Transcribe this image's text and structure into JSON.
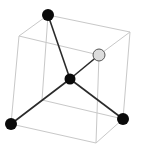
{
  "diagram": {
    "title": "",
    "colors": {
      "background": "#ffffff",
      "cube_edge": "#c8c8c8",
      "bond": "#2a2a2a",
      "atom_dark": "#0a0a0a",
      "atom_light": "#dcdcdc",
      "atom_light_stroke": "#555555"
    },
    "cube_vertices": {
      "top_back_left": [
        48,
        15
      ],
      "top_back_right": [
        130,
        32
      ],
      "top_front_right": [
        99,
        55
      ],
      "top_front_left": [
        19,
        36
      ],
      "bottom_back_left": [
        42,
        100
      ],
      "bottom_back_right": [
        123,
        119
      ],
      "bottom_front_right": [
        96,
        143
      ],
      "bottom_front_left": [
        11,
        124
      ]
    },
    "cube_edges": [
      [
        "top_back_left",
        "top_back_right"
      ],
      [
        "top_back_right",
        "top_front_right"
      ],
      [
        "top_front_right",
        "top_front_left"
      ],
      [
        "top_front_left",
        "top_back_left"
      ],
      [
        "bottom_back_left",
        "bottom_back_right"
      ],
      [
        "bottom_back_right",
        "bottom_front_right"
      ],
      [
        "bottom_front_right",
        "bottom_front_left"
      ],
      [
        "bottom_front_left",
        "bottom_back_left"
      ],
      [
        "top_back_left",
        "bottom_back_left"
      ],
      [
        "top_back_right",
        "bottom_back_right"
      ],
      [
        "top_front_right",
        "bottom_front_right"
      ],
      [
        "top_front_left",
        "bottom_front_left"
      ]
    ],
    "atoms": [
      {
        "id": "center",
        "x": 70,
        "y": 79,
        "r": 5.5,
        "color": "dark"
      },
      {
        "id": "top",
        "x": 48,
        "y": 15,
        "r": 6,
        "color": "dark"
      },
      {
        "id": "right-upper",
        "x": 99,
        "y": 55,
        "r": 6,
        "color": "light"
      },
      {
        "id": "bottom-left",
        "x": 11,
        "y": 124,
        "r": 6,
        "color": "dark"
      },
      {
        "id": "bottom-right",
        "x": 123,
        "y": 119,
        "r": 6,
        "color": "dark"
      }
    ],
    "bonds": [
      [
        "center",
        "top"
      ],
      [
        "center",
        "right-upper"
      ],
      [
        "center",
        "bottom-left"
      ],
      [
        "center",
        "bottom-right"
      ]
    ]
  }
}
